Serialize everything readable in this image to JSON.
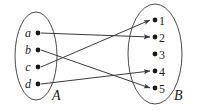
{
  "figure": {
    "background_color": "#ffffff",
    "line_color": "#3a3a3a",
    "ellipse_color": "#4b4b4b",
    "dot_color": "#1a1a1a"
  },
  "sets": {
    "left": {
      "name": "A",
      "label": "A",
      "label_x": 52,
      "label_y": 100,
      "ellipse": {
        "cx": 36,
        "cy": 56,
        "rx": 21,
        "ry": 44
      },
      "elements": [
        {
          "key": "a",
          "label": "a",
          "dot_x": 38,
          "dot_y": 33,
          "text_x": 28,
          "text_y": 37
        },
        {
          "key": "b",
          "label": "b",
          "dot_x": 38,
          "dot_y": 50,
          "text_x": 28,
          "text_y": 54
        },
        {
          "key": "c",
          "label": "c",
          "dot_x": 38,
          "dot_y": 67,
          "text_x": 28,
          "text_y": 71
        },
        {
          "key": "d",
          "label": "d",
          "dot_x": 38,
          "dot_y": 84,
          "text_x": 28,
          "text_y": 88
        }
      ]
    },
    "right": {
      "name": "B",
      "label": "B",
      "label_x": 174,
      "label_y": 100,
      "ellipse": {
        "cx": 155,
        "cy": 54,
        "rx": 27,
        "ry": 50
      },
      "elements": [
        {
          "key": "1",
          "label": "1",
          "dot_x": 155,
          "dot_y": 20,
          "text_x": 162,
          "text_y": 25
        },
        {
          "key": "2",
          "label": "2",
          "dot_x": 155,
          "dot_y": 37,
          "text_x": 162,
          "text_y": 42
        },
        {
          "key": "3",
          "label": "3",
          "dot_x": 155,
          "dot_y": 54,
          "text_x": 162,
          "text_y": 59
        },
        {
          "key": "4",
          "label": "4",
          "dot_x": 155,
          "dot_y": 71,
          "text_x": 162,
          "text_y": 76
        },
        {
          "key": "5",
          "label": "5",
          "dot_x": 155,
          "dot_y": 88,
          "text_x": 162,
          "text_y": 93
        }
      ]
    }
  },
  "chart_data": {
    "type": "diagram",
    "domain": [
      "a",
      "b",
      "c",
      "d"
    ],
    "codomain": [
      "1",
      "2",
      "3",
      "4",
      "5"
    ],
    "edges": [
      {
        "from": "a",
        "to": "2",
        "x1": 41,
        "y1": 33,
        "x2": 150,
        "y2": 37
      },
      {
        "from": "b",
        "to": "5",
        "x1": 41,
        "y1": 50,
        "x2": 150,
        "y2": 88
      },
      {
        "from": "c",
        "to": "1",
        "x1": 41,
        "y1": 67,
        "x2": 150,
        "y2": 20
      },
      {
        "from": "d",
        "to": "4",
        "x1": 41,
        "y1": 84,
        "x2": 150,
        "y2": 71
      }
    ],
    "unmapped_codomain": [
      "3"
    ]
  }
}
